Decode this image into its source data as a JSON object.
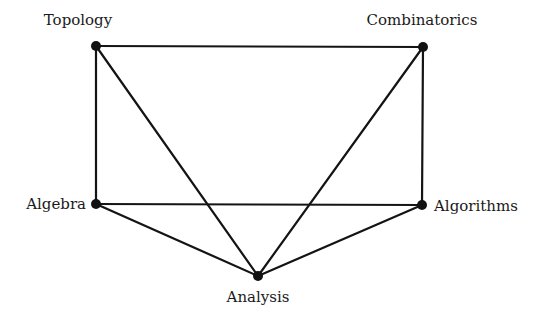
{
  "diagram": {
    "type": "graph",
    "nodes": [
      {
        "id": "topology",
        "label": "Topology",
        "x": 96,
        "y": 46,
        "label_x": 78,
        "label_y": 25,
        "anchor": "middle"
      },
      {
        "id": "combinatorics",
        "label": "Combinatorics",
        "x": 423,
        "y": 47,
        "label_x": 422,
        "label_y": 25,
        "anchor": "middle"
      },
      {
        "id": "algebra",
        "label": "Algebra",
        "x": 96,
        "y": 204,
        "label_x": 86,
        "label_y": 209,
        "anchor": "end"
      },
      {
        "id": "algorithms",
        "label": "Algorithms",
        "x": 422,
        "y": 205,
        "label_x": 434,
        "label_y": 211,
        "anchor": "start"
      },
      {
        "id": "analysis",
        "label": "Analysis",
        "x": 258,
        "y": 276,
        "label_x": 258,
        "label_y": 302,
        "anchor": "middle"
      }
    ],
    "edges": [
      [
        "topology",
        "combinatorics"
      ],
      [
        "topology",
        "algebra"
      ],
      [
        "topology",
        "analysis"
      ],
      [
        "combinatorics",
        "algorithms"
      ],
      [
        "combinatorics",
        "analysis"
      ],
      [
        "algebra",
        "algorithms"
      ],
      [
        "algebra",
        "analysis"
      ],
      [
        "algorithms",
        "analysis"
      ]
    ],
    "colors": {
      "edge": "#141414",
      "node": "#111111",
      "label": "#1a1a1a",
      "background": "#ffffff"
    }
  }
}
